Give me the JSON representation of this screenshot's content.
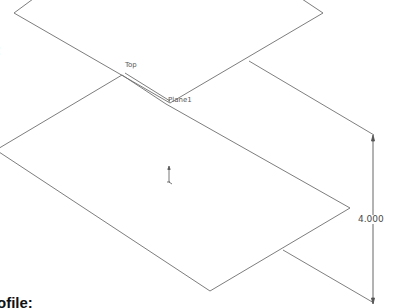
{
  "document": {
    "cut_label_top": ":",
    "cut_label_bottom": "ofile:"
  },
  "viewport": {
    "planes": [
      {
        "name": "Top",
        "label": "Top"
      },
      {
        "name": "Plane1",
        "label": "Plane1"
      }
    ],
    "dimension": {
      "value": "4.000"
    },
    "colors": {
      "edge": "#6e6e6e",
      "dimension": "#555555",
      "background": "#ffffff"
    }
  }
}
